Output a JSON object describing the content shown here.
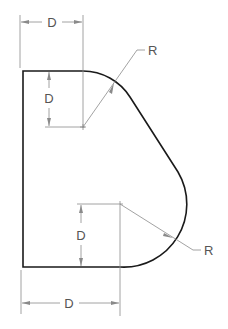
{
  "drawing": {
    "title": "Profile with two tangent radii",
    "labels": {
      "top_width": "D",
      "top_drop": "D",
      "top_radius": "R",
      "bottom_rise": "D",
      "bottom_radius": "R",
      "bottom_width": "D"
    },
    "colors": {
      "object_line": "#1a1a1a",
      "dimension_line": "#8a8a8a",
      "label": "#555555"
    }
  }
}
